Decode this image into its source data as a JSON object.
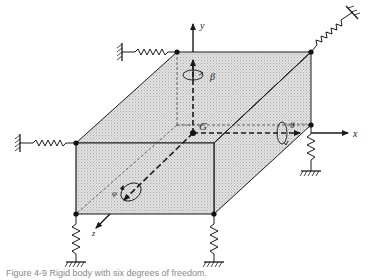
{
  "figure": {
    "type": "rigid-body-on-springs",
    "colors": {
      "fill": "#d9d9d9",
      "stroke": "#1a1a1a",
      "background": "#ffffff"
    },
    "labels": {
      "y_axis": "y",
      "x_axis": "x",
      "z_axis": "z",
      "center": "G",
      "rot_y": "β",
      "rot_x": "θ",
      "rot_z": "φ"
    },
    "springs": [
      {
        "name": "spring-top-back-left",
        "direction": "horizontal"
      },
      {
        "name": "spring-top-back-right",
        "direction": "diagonal"
      },
      {
        "name": "spring-front-top-left",
        "direction": "horizontal"
      },
      {
        "name": "spring-front-bottom-left",
        "direction": "vertical"
      },
      {
        "name": "spring-front-bottom-right",
        "direction": "vertical"
      },
      {
        "name": "spring-back-bottom-right",
        "direction": "vertical"
      }
    ]
  },
  "caption": {
    "text": "Figure 4-9  Rigid body with six degrees of freedom."
  }
}
